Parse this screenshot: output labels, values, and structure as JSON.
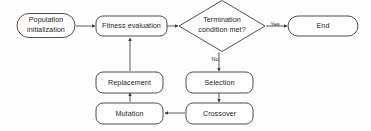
{
  "diagram": {
    "background_color": "#fefefe",
    "stroke_color": "#3a3a3a",
    "text_color": "#1c1c1c",
    "nodes": [
      {
        "id": "population-initialization",
        "shape": "stadium",
        "label_line1": "Population",
        "label_line2": "initialization"
      },
      {
        "id": "fitness-evaluation",
        "shape": "rounded-rect",
        "label": "Fitness evaluation"
      },
      {
        "id": "termination-condition",
        "shape": "diamond",
        "label_line1": "Termination",
        "label_line2": "condition met?"
      },
      {
        "id": "end",
        "shape": "stadium",
        "label": "End"
      },
      {
        "id": "selection",
        "shape": "rounded-rect",
        "label": "Selection"
      },
      {
        "id": "crossover",
        "shape": "rounded-rect",
        "label": "Crossover"
      },
      {
        "id": "mutation",
        "shape": "rounded-rect",
        "label": "Mutation"
      },
      {
        "id": "replacement",
        "shape": "rounded-rect",
        "label": "Replacement"
      }
    ],
    "edge_labels": {
      "yes": "Yes",
      "no": "No"
    }
  }
}
